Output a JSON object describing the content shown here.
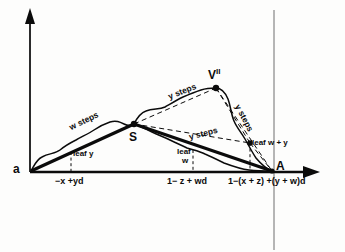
{
  "figure": {
    "type": "diagram",
    "background_color": "#fdfdfc",
    "line_color": "#0b0b0b"
  },
  "axes": {
    "y_axis": {
      "name": "vertical-axis",
      "arrow": "up"
    },
    "x_axis": {
      "name": "horizontal-axis",
      "arrow": "right"
    },
    "vertical_guide": {
      "name": "vertical-guide-line"
    }
  },
  "nodes": [
    {
      "id": "a",
      "label": "a"
    },
    {
      "id": "S",
      "label": "S"
    },
    {
      "id": "Vpp",
      "label": "V",
      "superscript": "II"
    },
    {
      "id": "A",
      "label": "A"
    }
  ],
  "axis_labels": [
    {
      "id": "tick-left",
      "text": "−x +yd"
    },
    {
      "id": "tick-mid",
      "text": "1− z + wd"
    },
    {
      "id": "tick-right",
      "text": "1−(x + z) +(y + w)d"
    }
  ],
  "annotations": [
    {
      "id": "w-steps-left",
      "text": "w steps"
    },
    {
      "id": "y-steps-upper",
      "text": "y steps"
    },
    {
      "id": "y-steps-middle",
      "text": "y steps"
    },
    {
      "id": "y-steps-right",
      "text": "y steps"
    },
    {
      "id": "leaf-y",
      "text": "leaf y"
    },
    {
      "id": "leaf-w-line1",
      "text": "leaf"
    },
    {
      "id": "leaf-w-line2",
      "text": "w"
    },
    {
      "id": "leaf-w-plus-y",
      "text": "leaf w + y"
    }
  ]
}
